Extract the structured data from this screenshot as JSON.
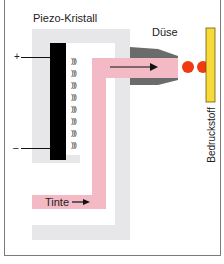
{
  "labels": {
    "crystal": "Piezo-Kristall",
    "nozzle": "Düse",
    "ink": "Tinte",
    "substrate": "Bedruckstoff",
    "plus": "+",
    "minus": "–"
  },
  "waves": [
    ")))",
    ")))",
    ")))",
    ")))",
    ")))",
    ")))",
    ")))",
    ")))"
  ],
  "colors": {
    "frame_gray": "#e7e7e9",
    "ink_pink": "#f3b9c4",
    "nozzle_gray": "#6b6b6b",
    "crystal_black": "#000000",
    "drop_red": "#ef3a12",
    "substrate_yellow": "#f7d938"
  }
}
